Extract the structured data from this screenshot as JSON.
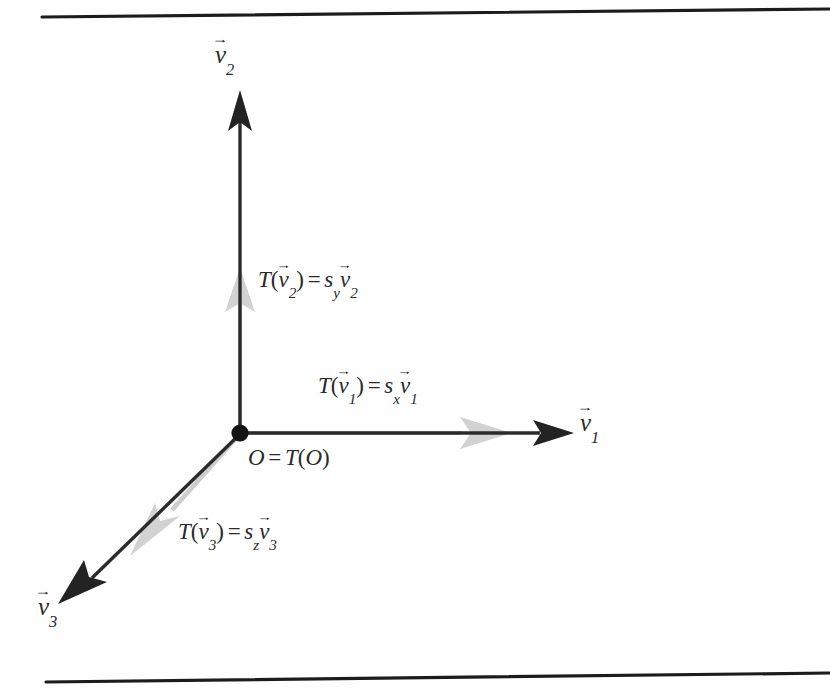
{
  "figure": {
    "kind": "vector-scaling-diagram",
    "background_color": "#fefefe",
    "rule_color": "#1c1c1c",
    "axis_black_color": "#262626",
    "axis_gray_color": "#c9c9c9",
    "origin_dot_color": "#141414"
  },
  "axis_labels": {
    "y_axis": {
      "symbol": "v",
      "subscript": "2",
      "overset": "vector-arrow"
    },
    "x_axis": {
      "symbol": "v",
      "subscript": "1",
      "overset": "vector-arrow"
    },
    "z_axis": {
      "symbol": "v",
      "subscript": "3",
      "overset": "vector-arrow"
    }
  },
  "equations": {
    "y_axis": {
      "lhs_function": "T",
      "lhs_arg": {
        "symbol": "v",
        "subscript": "2"
      },
      "relation": "=",
      "scalar": {
        "symbol": "s",
        "subscript": "y"
      },
      "rhs_vector": {
        "symbol": "v",
        "subscript": "2"
      },
      "plain": "T(v2) = s_y v2"
    },
    "x_axis": {
      "lhs_function": "T",
      "lhs_arg": {
        "symbol": "v",
        "subscript": "1"
      },
      "relation": "=",
      "scalar": {
        "symbol": "s",
        "subscript": "x"
      },
      "rhs_vector": {
        "symbol": "v",
        "subscript": "1"
      },
      "plain": "T(v1) = s_x v1"
    },
    "z_axis": {
      "lhs_function": "T",
      "lhs_arg": {
        "symbol": "v",
        "subscript": "3"
      },
      "relation": "=",
      "scalar": {
        "symbol": "s",
        "subscript": "z"
      },
      "rhs_vector": {
        "symbol": "v",
        "subscript": "3"
      },
      "plain": "T(v3) = s_z v3"
    }
  },
  "origin": {
    "left_symbol": "O",
    "relation": "=",
    "function": "T",
    "arg": "O",
    "plain": "O = T(O)"
  }
}
